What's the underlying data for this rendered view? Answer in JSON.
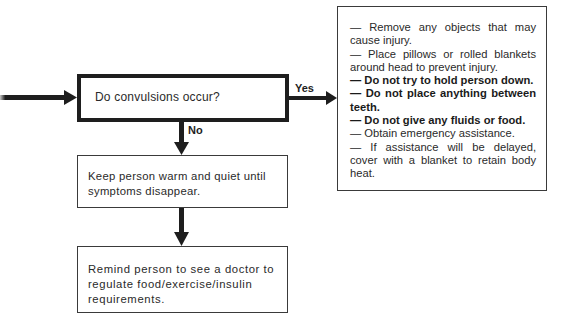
{
  "flowchart": {
    "decision": {
      "text": "Do convulsions occur?"
    },
    "branches": {
      "yes_label": "Yes",
      "no_label": "No"
    },
    "no_steps": [
      {
        "text": "Keep person warm and quiet until symptoms disappear."
      },
      {
        "text": "Remind person to see a doctor to regulate food/exercise/insulin requirements."
      }
    ],
    "yes_actions": [
      {
        "text": "— Remove any objects that may cause injury.",
        "bold": false
      },
      {
        "text": "— Place pillows or rolled blankets around head to prevent injury.",
        "bold": false
      },
      {
        "text": "— Do not try to hold person down.",
        "bold": true
      },
      {
        "text": "— Do not place anything between teeth.",
        "bold": true
      },
      {
        "text": "— Do not give any fluids or food.",
        "bold": true
      },
      {
        "text": "— Obtain emergency assistance.",
        "bold": false
      },
      {
        "text": "— If assistance will be delayed, cover with a blanket to retain body heat.",
        "bold": false
      }
    ],
    "colors": {
      "line": "#1e1e1e",
      "text": "#2a2a2a",
      "background": "#ffffff"
    }
  }
}
